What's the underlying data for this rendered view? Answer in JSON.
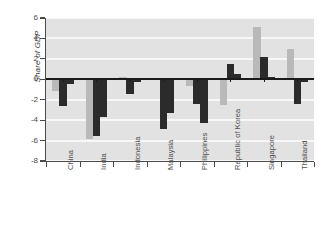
{
  "chart_data": {
    "type": "bar",
    "title": "",
    "subtitle": "",
    "xlabel": "",
    "ylabel": "Share of GDP",
    "ylim": [
      -8,
      6
    ],
    "yticks": [
      6,
      4,
      2,
      0,
      -2,
      -4,
      -6,
      -8
    ],
    "ytick_labels": [
      "6",
      "4",
      "2",
      "0",
      "-2",
      "-4",
      "-6",
      "-8"
    ],
    "grid": true,
    "grid_orientation": "horizontal",
    "legend": false,
    "legend_position": "none",
    "plot_background": "#e2e2e2",
    "gridline_color": "#f7f7f7",
    "categories": [
      "China",
      "India",
      "Indonesia",
      "Malaysia",
      "Philippines",
      "Republic of Korea",
      "Singapore",
      "Thailand"
    ],
    "series": [
      {
        "name": "series-1",
        "color": "#b9b9b9",
        "values": [
          -1.1,
          -5.8,
          0.2,
          -0.1,
          -0.7,
          -2.5,
          5.1,
          3.0
        ]
      },
      {
        "name": "series-2",
        "color": "#2b2b2b",
        "values": [
          -2.6,
          -5.6,
          -1.4,
          -4.9,
          -2.4,
          1.5,
          2.2,
          -2.4
        ]
      },
      {
        "name": "series-3",
        "color": "#2b2b2b",
        "values": [
          -0.5,
          -3.7,
          -0.3,
          -3.3,
          -4.3,
          0.5,
          0.2,
          -0.3
        ]
      }
    ]
  },
  "axis": {
    "y_title": "Share of GDP"
  }
}
